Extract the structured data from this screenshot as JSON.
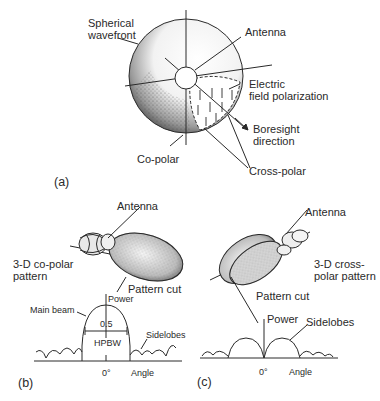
{
  "panel_a": {
    "tag": "(a)",
    "labels": {
      "spherical_wavefront_1": "Spherical",
      "spherical_wavefront_2": "wavefront",
      "antenna": "Antenna",
      "electric_1": "Electric",
      "electric_2": "field polarization",
      "boresight_1": "Boresight",
      "boresight_2": "direction",
      "co_polar": "Co-polar",
      "cross_polar": "Cross-polar"
    }
  },
  "panel_b": {
    "tag": "(b)",
    "labels": {
      "antenna": "Antenna",
      "pattern_1": "3-D co-polar",
      "pattern_2": "pattern",
      "pattern_cut": "Pattern cut",
      "main_beam": "Main beam",
      "power": "Power",
      "half": "0.5",
      "hpbw": "HPBW",
      "sidelobes": "Sidelobes",
      "zero": "0°",
      "angle": "Angle"
    }
  },
  "panel_c": {
    "tag": "(c)",
    "labels": {
      "antenna": "Antenna",
      "pattern_1": "3-D cross-",
      "pattern_2": "polar pattern",
      "pattern_cut": "Pattern cut",
      "power": "Power",
      "sidelobes": "Sidelobes",
      "zero": "0°",
      "angle": "Angle"
    }
  },
  "colors": {
    "ink": "#2a2a2a",
    "shade": "#6a6a6a",
    "paper": "#ffffff"
  }
}
